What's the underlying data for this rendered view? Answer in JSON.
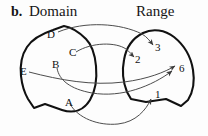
{
  "figure": {
    "caption_letter": "b.",
    "width": 208,
    "height": 136,
    "background_color": "#fdfdfd",
    "outline_color": "#111111",
    "arrow_color": "#4d4d4d",
    "text_color": "#111111"
  },
  "headers": {
    "domain": "Domain",
    "range": "Range"
  },
  "domain_set": {
    "name": "Domain",
    "elements": [
      {
        "id": "D",
        "label": "D",
        "x": 50,
        "y": 34
      },
      {
        "id": "C",
        "label": "C",
        "x": 72,
        "y": 52
      },
      {
        "id": "B",
        "label": "B",
        "x": 55,
        "y": 64
      },
      {
        "id": "E",
        "label": "E",
        "x": 23,
        "y": 71
      },
      {
        "id": "A",
        "label": "A",
        "x": 68,
        "y": 102
      }
    ]
  },
  "range_set": {
    "name": "Range",
    "elements": [
      {
        "id": "3",
        "label": "3",
        "x": 157,
        "y": 47
      },
      {
        "id": "2",
        "label": "2",
        "x": 137,
        "y": 59
      },
      {
        "id": "6",
        "label": "6",
        "x": 181,
        "y": 68
      },
      {
        "id": "1",
        "label": "1",
        "x": 157,
        "y": 94
      }
    ]
  },
  "mappings": [
    {
      "from": "D",
      "to": "3"
    },
    {
      "from": "C",
      "to": "2"
    },
    {
      "from": "B",
      "to": "6"
    },
    {
      "from": "E",
      "to": "6"
    },
    {
      "from": "A",
      "to": "1"
    }
  ]
}
